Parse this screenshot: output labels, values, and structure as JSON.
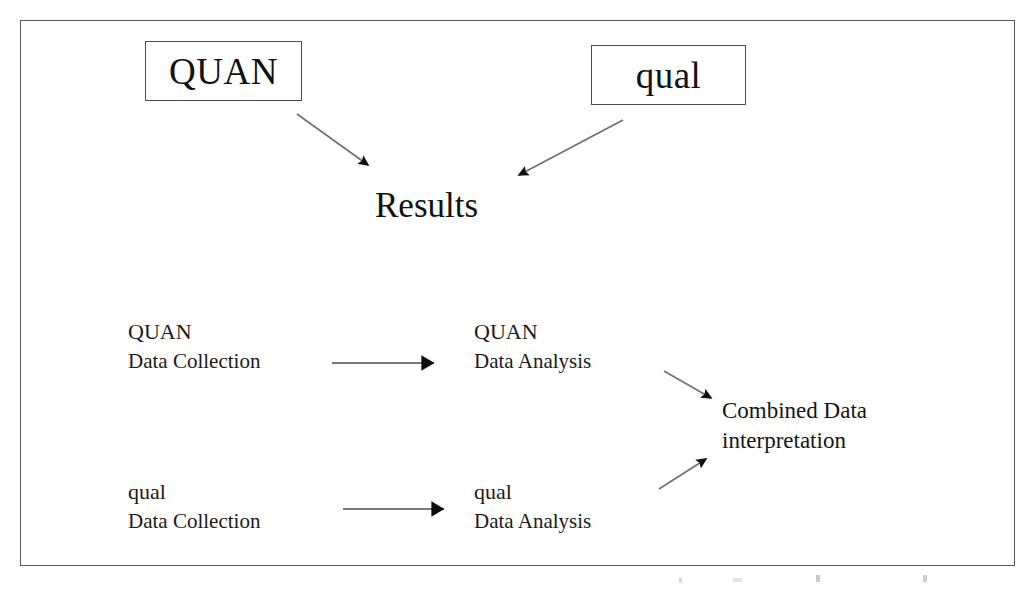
{
  "figure": {
    "frame": {
      "border_color": "#58585c"
    },
    "ink_color": "#111111"
  },
  "top_boxes": [
    {
      "id": "quan",
      "label": "QUAN"
    },
    {
      "id": "qual",
      "label": "qual"
    }
  ],
  "results": {
    "label": "Results"
  },
  "stages": [
    {
      "id": "quan-collection",
      "title": "QUAN",
      "sub": "Data Collection"
    },
    {
      "id": "quan-analysis",
      "title": "QUAN",
      "sub": "Data Analysis"
    },
    {
      "id": "qual-collection",
      "title": "qual",
      "sub": "Data Collection"
    },
    {
      "id": "qual-analysis",
      "title": "qual",
      "sub": "Data Analysis"
    }
  ],
  "combined": {
    "line1": "Combined Data",
    "line2": "interpretation"
  },
  "arrows": [
    {
      "id": "quan-box-to-results",
      "from": "QUAN box",
      "to": "Results",
      "style": "thin-diagonal",
      "x1": 297,
      "y1": 114,
      "x2": 372,
      "y2": 169
    },
    {
      "id": "qual-box-to-results",
      "from": "qual box",
      "to": "Results",
      "style": "thin-diagonal",
      "x1": 623,
      "y1": 120,
      "x2": 514,
      "y2": 178
    },
    {
      "id": "quan-collection-to-analysis",
      "from": "QUAN Data Collection",
      "to": "QUAN Data Analysis",
      "style": "thick-head-horizontal",
      "x1": 332,
      "y1": 363,
      "x2": 448,
      "y2": 363
    },
    {
      "id": "qual-collection-to-analysis",
      "from": "qual Data Collection",
      "to": "qual Data Analysis",
      "style": "thick-head-horizontal",
      "x1": 343,
      "y1": 509,
      "x2": 458,
      "y2": 509
    },
    {
      "id": "quan-analysis-to-combined",
      "from": "QUAN Data Analysis",
      "to": "Combined Data interpretation",
      "style": "thin-diagonal",
      "x1": 664,
      "y1": 371,
      "x2": 716,
      "y2": 402
    },
    {
      "id": "qual-analysis-to-combined",
      "from": "qual Data Analysis",
      "to": "Combined Data interpretation",
      "style": "thin-diagonal",
      "x1": 659,
      "y1": 489,
      "x2": 711,
      "y2": 455
    }
  ]
}
